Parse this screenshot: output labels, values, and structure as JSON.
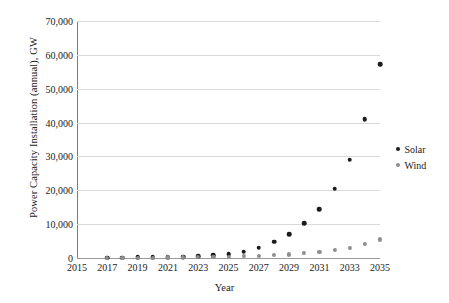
{
  "chart_data": {
    "type": "scatter",
    "title": "",
    "xlabel": "Year",
    "ylabel": "Power Capacity Installation (annual), GW",
    "xlim": [
      2015,
      2035
    ],
    "ylim": [
      0,
      70000
    ],
    "grid": true,
    "legend_position": "right",
    "x": [
      2017,
      2018,
      2019,
      2020,
      2021,
      2022,
      2023,
      2024,
      2025,
      2026,
      2027,
      2028,
      2029,
      2030,
      2031,
      2032,
      2033,
      2034,
      2035
    ],
    "series": [
      {
        "name": "Solar",
        "color": "#1b1b1b",
        "values": [
          100,
          140,
          180,
          230,
          300,
          390,
          520,
          750,
          1150,
          1900,
          3100,
          4800,
          7100,
          10200,
          14400,
          20500,
          29000,
          41000,
          57300
        ]
      },
      {
        "name": "Wind",
        "color": "#8e8e8e",
        "values": [
          60,
          80,
          100,
          130,
          160,
          200,
          250,
          320,
          400,
          500,
          630,
          800,
          1050,
          1400,
          1850,
          2400,
          3100,
          4100,
          5500
        ]
      }
    ],
    "y_ticks": [
      "0",
      "10,000",
      "20,000",
      "30,000",
      "40,000",
      "50,000",
      "60,000",
      "70,000"
    ],
    "y_tick_values": [
      0,
      10000,
      20000,
      30000,
      40000,
      50000,
      60000,
      70000
    ],
    "x_ticks": [
      "2015",
      "2017",
      "2019",
      "2021",
      "2023",
      "2025",
      "2027",
      "2029",
      "2031",
      "2033",
      "2035"
    ],
    "x_tick_values": [
      2015,
      2017,
      2019,
      2021,
      2023,
      2025,
      2027,
      2029,
      2031,
      2033,
      2035
    ]
  },
  "legend": {
    "items": [
      {
        "label": "Solar"
      },
      {
        "label": "Wind"
      }
    ]
  }
}
